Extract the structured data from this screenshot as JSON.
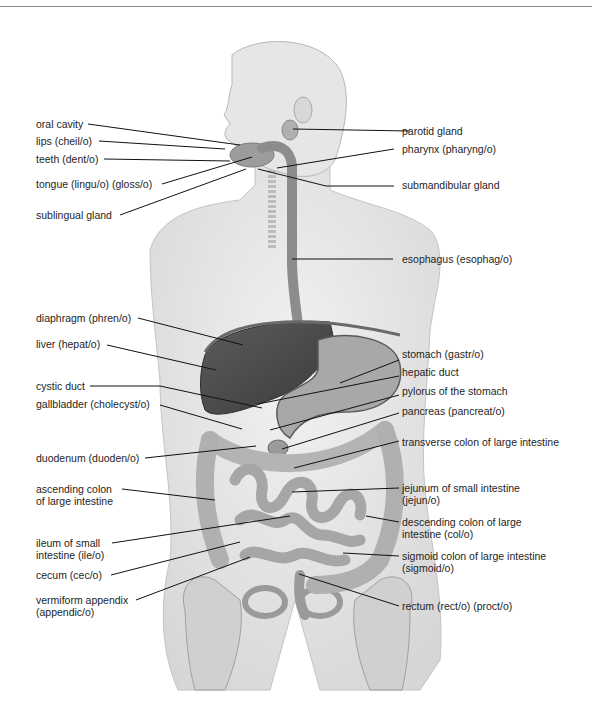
{
  "figure": {
    "colors": {
      "skin": "#e9e9e9",
      "skin_shadow": "#cfcfcf",
      "organ_dark": "#4a4a4a",
      "organ_mid": "#8f8f8f",
      "organ_light": "#bdbdbd",
      "leader": "#111111"
    }
  },
  "labels_left": [
    {
      "id": "oral-cavity",
      "text": "oral cavity"
    },
    {
      "id": "lips",
      "text": "lips  (cheil/o)"
    },
    {
      "id": "teeth",
      "text": "teeth  (dent/o)"
    },
    {
      "id": "tongue",
      "text": "tongue  (lingu/o)  (gloss/o)"
    },
    {
      "id": "sublingual-gland",
      "text": "sublingual gland"
    },
    {
      "id": "diaphragm",
      "text": "diaphragm  (phren/o)"
    },
    {
      "id": "liver",
      "text": "liver  (hepat/o)"
    },
    {
      "id": "cystic-duct",
      "text": "cystic duct"
    },
    {
      "id": "gallbladder",
      "text": "gallbladder  (cholecyst/o)"
    },
    {
      "id": "duodenum",
      "text": "duodenum  (duoden/o)"
    },
    {
      "id": "ascending-colon",
      "line1": "ascending colon",
      "line2": "of large intestine"
    },
    {
      "id": "ileum",
      "line1": "ileum of small",
      "line2": "intestine  (ile/o)"
    },
    {
      "id": "cecum",
      "text": "cecum  (cec/o)"
    },
    {
      "id": "appendix",
      "line1": "vermiform appendix",
      "line2": "(appendic/o)"
    }
  ],
  "labels_right": [
    {
      "id": "parotid-gland",
      "text": "parotid gland"
    },
    {
      "id": "pharynx",
      "text": "pharynx  (pharyng/o)"
    },
    {
      "id": "submandibular-gland",
      "text": "submandibular gland"
    },
    {
      "id": "esophagus",
      "text": "esophagus  (esophag/o)"
    },
    {
      "id": "stomach",
      "text": "stomach  (gastr/o)"
    },
    {
      "id": "hepatic-duct",
      "text": "hepatic duct"
    },
    {
      "id": "pylorus",
      "text": "pylorus of the stomach"
    },
    {
      "id": "pancreas",
      "text": "pancreas  (pancreat/o)"
    },
    {
      "id": "transverse-colon",
      "text": "transverse colon of large intestine"
    },
    {
      "id": "jejunum",
      "line1": "jejunum of small intestine",
      "line2": "(jejun/o)"
    },
    {
      "id": "descending-colon",
      "line1": "descending colon of large",
      "line2": "intestine  (col/o)"
    },
    {
      "id": "sigmoid-colon",
      "line1": "sigmoid colon of large intestine",
      "line2": "(sigmoid/o)"
    },
    {
      "id": "rectum",
      "text": "rectum  (rect/o)  (proct/o)"
    }
  ]
}
